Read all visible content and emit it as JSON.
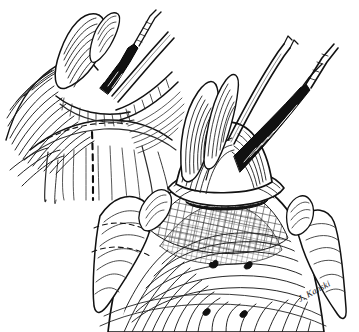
{
  "figure": {
    "kind": "pen-and-ink medical illustration",
    "discipline": "ophthalmic surgery",
    "background_color": "#ffffff",
    "ink_color": "#111111",
    "mid_ink_color": "#3a3a3a",
    "light_ink_color": "#6b6b6b",
    "width": 359,
    "height": 332,
    "panel_count": 2,
    "has_border": false,
    "title": "",
    "caption": "",
    "label_text": ""
  },
  "signature": {
    "text": "J. Kanski",
    "style": "cursive italic",
    "position": "bottom-right",
    "x": 300,
    "y": 302,
    "rotation": -28,
    "color": "#1a1a1a"
  },
  "panels": [
    {
      "id": "upper-left-panel",
      "name": "Upper left figure — tissue flap retracted, dashed incision marked",
      "region": {
        "x": 0,
        "y": 8,
        "width": 185,
        "height": 175
      },
      "features": [
        "retracted conjunctival flap with dense hatching",
        "two surgical instruments entering from upper right",
        "toothed forceps grasping tissue edge",
        "vertical dashed incision line on exposed surface",
        "horizontal limbal arc line"
      ]
    },
    {
      "id": "lower-right-panel",
      "name": "Lower right figure — elevated mound with cross-hatched surface",
      "region": {
        "x": 95,
        "y": 30,
        "width": 264,
        "height": 300
      },
      "features": [
        "bulbous elevated tissue dome held by instrument",
        "collar / ring of tissue beneath dome",
        "broad cross-hatched globe surface",
        "radiating curved stroke texture",
        "four dark vortex-vein marks",
        "lateral tissue lobes at left and right"
      ]
    }
  ],
  "markings": {
    "dashed_incision": {
      "label": "dashed incision line",
      "orientation": "vertical",
      "dash_pattern": "6 5",
      "stroke_width": 2.1
    },
    "dashed_arc": {
      "label": "dashed limbal arc",
      "orientation": "horizontal",
      "dash_pattern": "5 4",
      "stroke_width": 1.1
    },
    "dark_spots": {
      "label": "vortex vein ampullae",
      "count": 4,
      "color": "#101010",
      "points": [
        {
          "x": 213,
          "y": 262,
          "r": 3.4
        },
        {
          "x": 248,
          "y": 263,
          "r": 3.2
        },
        {
          "x": 205,
          "y": 310,
          "r": 3.3
        },
        {
          "x": 242,
          "y": 312,
          "r": 3.1
        }
      ]
    }
  },
  "instruments": [
    {
      "id": "instrument-upper-forceps",
      "label": "toothed forceps",
      "panel": "upper-left-panel"
    },
    {
      "id": "instrument-upper-probe",
      "label": "fine probe / needle holder",
      "panel": "upper-left-panel"
    },
    {
      "id": "instrument-lower-forceps",
      "label": "toothed forceps",
      "panel": "lower-right-panel"
    },
    {
      "id": "instrument-lower-hook",
      "label": "muscle hook / cannula",
      "panel": "lower-right-panel"
    }
  ]
}
